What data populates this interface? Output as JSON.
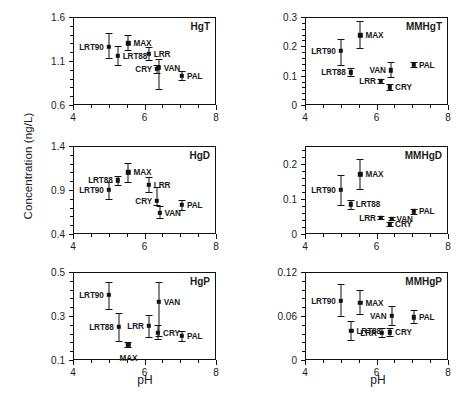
{
  "figure": {
    "y_axis_title": "Concentration (ng/L)",
    "x_axis_title": "pH",
    "site_names": [
      "LRT90",
      "LRT88",
      "MAX",
      "LRR",
      "CRY",
      "VAN",
      "PAL"
    ],
    "marker_color": "#111111"
  },
  "chart_data": [
    {
      "type": "scatter",
      "title": "HgT",
      "xlabel": "pH",
      "ylabel": "Concentration (ng/L)",
      "xlim": [
        4,
        8
      ],
      "ylim": [
        0.6,
        1.6
      ],
      "xticks": [
        4,
        6,
        8
      ],
      "xtick_labels": [
        "4",
        "6",
        "8"
      ],
      "yticks": [
        0.6,
        1.1,
        1.6
      ],
      "ytick_labels": [
        "0.6",
        "1.1",
        "1.6"
      ],
      "grid": false,
      "legend": "none",
      "points": [
        {
          "label": "LRT90",
          "x": 5.0,
          "y": 1.26,
          "ylo": 1.13,
          "yhi": 1.42,
          "label_side": "left"
        },
        {
          "label": "LRT88",
          "x": 5.25,
          "y": 1.16,
          "ylo": 1.06,
          "yhi": 1.27,
          "label_side": "right"
        },
        {
          "label": "MAX",
          "x": 5.55,
          "y": 1.3,
          "ylo": 1.23,
          "yhi": 1.39,
          "label_side": "right"
        },
        {
          "label": "LRR",
          "x": 6.12,
          "y": 1.18,
          "ylo": 1.11,
          "yhi": 1.26,
          "label_side": "right"
        },
        {
          "label": "CRY",
          "x": 6.35,
          "y": 1.01,
          "ylo": 0.96,
          "yhi": 1.06,
          "label_side": "left"
        },
        {
          "label": "VAN",
          "x": 6.4,
          "y": 1.02,
          "ylo": 0.78,
          "yhi": 1.12,
          "label_side": "right"
        },
        {
          "label": "PAL",
          "x": 7.05,
          "y": 0.93,
          "ylo": 0.88,
          "yhi": 0.99,
          "label_side": "right"
        }
      ]
    },
    {
      "type": "scatter",
      "title": "MMHgT",
      "xlabel": "pH",
      "ylabel": "Concentration (ng/L)",
      "xlim": [
        4,
        8
      ],
      "ylim": [
        0,
        0.3
      ],
      "xticks": [
        4,
        6,
        8
      ],
      "xtick_labels": [
        "4",
        "6",
        "8"
      ],
      "yticks": [
        0,
        0.1,
        0.2,
        0.3
      ],
      "ytick_labels": [
        "0",
        "0.1",
        "0.2",
        "0.3"
      ],
      "grid": false,
      "legend": "none",
      "points": [
        {
          "label": "LRT90",
          "x": 5.0,
          "y": 0.185,
          "ylo": 0.135,
          "yhi": 0.225,
          "label_side": "left"
        },
        {
          "label": "LRT88",
          "x": 5.28,
          "y": 0.112,
          "ylo": 0.1,
          "yhi": 0.125,
          "label_side": "left"
        },
        {
          "label": "MAX",
          "x": 5.55,
          "y": 0.238,
          "ylo": 0.195,
          "yhi": 0.285,
          "label_side": "right"
        },
        {
          "label": "LRR",
          "x": 6.12,
          "y": 0.082,
          "ylo": 0.074,
          "yhi": 0.09,
          "label_side": "left"
        },
        {
          "label": "CRY",
          "x": 6.38,
          "y": 0.06,
          "ylo": 0.05,
          "yhi": 0.07,
          "label_side": "right"
        },
        {
          "label": "VAN",
          "x": 6.4,
          "y": 0.118,
          "ylo": 0.095,
          "yhi": 0.148,
          "label_side": "left"
        },
        {
          "label": "PAL",
          "x": 7.05,
          "y": 0.137,
          "ylo": 0.128,
          "yhi": 0.148,
          "label_side": "right"
        }
      ]
    },
    {
      "type": "scatter",
      "title": "HgD",
      "xlabel": "pH",
      "ylabel": "Concentration (ng/L)",
      "xlim": [
        4,
        8
      ],
      "ylim": [
        0.4,
        1.4
      ],
      "xticks": [
        4,
        6,
        8
      ],
      "xtick_labels": [
        "4",
        "6",
        "8"
      ],
      "yticks": [
        0.4,
        0.9,
        1.4
      ],
      "ytick_labels": [
        "0.4",
        "0.9",
        "1.4"
      ],
      "grid": false,
      "legend": "none",
      "points": [
        {
          "label": "LRT90",
          "x": 5.0,
          "y": 0.9,
          "ylo": 0.8,
          "yhi": 0.99,
          "label_side": "left"
        },
        {
          "label": "LRT88",
          "x": 5.25,
          "y": 1.01,
          "ylo": 0.96,
          "yhi": 1.06,
          "label_side": "left"
        },
        {
          "label": "MAX",
          "x": 5.55,
          "y": 1.1,
          "ylo": 0.99,
          "yhi": 1.21,
          "label_side": "right"
        },
        {
          "label": "LRR",
          "x": 6.12,
          "y": 0.96,
          "ylo": 0.88,
          "yhi": 1.05,
          "label_side": "right"
        },
        {
          "label": "CRY",
          "x": 6.35,
          "y": 0.78,
          "ylo": 0.73,
          "yhi": 0.93,
          "label_side": "left"
        },
        {
          "label": "VAN",
          "x": 6.42,
          "y": 0.64,
          "ylo": 0.58,
          "yhi": 0.72,
          "label_side": "right"
        },
        {
          "label": "PAL",
          "x": 7.05,
          "y": 0.73,
          "ylo": 0.67,
          "yhi": 0.79,
          "label_side": "right"
        }
      ]
    },
    {
      "type": "scatter",
      "title": "MMHgD",
      "xlabel": "pH",
      "ylabel": "Concentration (ng/L)",
      "xlim": [
        4,
        8
      ],
      "ylim": [
        0,
        0.25
      ],
      "xticks": [
        4,
        6,
        8
      ],
      "xtick_labels": [
        "4",
        "6",
        "8"
      ],
      "yticks": [
        0,
        0.1,
        0.2
      ],
      "ytick_labels": [
        "0",
        "0.1",
        "0.2"
      ],
      "grid": false,
      "legend": "none",
      "points": [
        {
          "label": "LRT90",
          "x": 5.0,
          "y": 0.125,
          "ylo": 0.082,
          "yhi": 0.168,
          "label_side": "left"
        },
        {
          "label": "LRT88",
          "x": 5.28,
          "y": 0.084,
          "ylo": 0.072,
          "yhi": 0.096,
          "label_side": "right"
        },
        {
          "label": "MAX",
          "x": 5.55,
          "y": 0.17,
          "ylo": 0.128,
          "yhi": 0.212,
          "label_side": "right"
        },
        {
          "label": "LRR",
          "x": 6.12,
          "y": 0.046,
          "ylo": 0.042,
          "yhi": 0.05,
          "label_side": "left"
        },
        {
          "label": "CRY",
          "x": 6.38,
          "y": 0.028,
          "ylo": 0.022,
          "yhi": 0.035,
          "label_side": "right"
        },
        {
          "label": "VAN",
          "x": 6.42,
          "y": 0.043,
          "ylo": 0.039,
          "yhi": 0.048,
          "label_side": "right"
        },
        {
          "label": "PAL",
          "x": 7.05,
          "y": 0.065,
          "ylo": 0.058,
          "yhi": 0.072,
          "label_side": "right"
        }
      ]
    },
    {
      "type": "scatter",
      "title": "HgP",
      "xlabel": "pH",
      "ylabel": "Concentration (ng/L)",
      "xlim": [
        4,
        8
      ],
      "ylim": [
        0.1,
        0.5
      ],
      "xticks": [
        4,
        6,
        8
      ],
      "xtick_labels": [
        "4",
        "6",
        "8"
      ],
      "yticks": [
        0.1,
        0.3,
        0.5
      ],
      "ytick_labels": [
        "0.1",
        "0.3",
        "0.5"
      ],
      "grid": false,
      "legend": "none",
      "points": [
        {
          "label": "LRT90",
          "x": 5.0,
          "y": 0.395,
          "ylo": 0.33,
          "yhi": 0.455,
          "label_side": "left"
        },
        {
          "label": "LRT88",
          "x": 5.28,
          "y": 0.25,
          "ylo": 0.185,
          "yhi": 0.315,
          "label_side": "left"
        },
        {
          "label": "MAX",
          "x": 5.55,
          "y": 0.17,
          "ylo": 0.158,
          "yhi": 0.182,
          "label_side": "below"
        },
        {
          "label": "LRR",
          "x": 6.12,
          "y": 0.255,
          "ylo": 0.205,
          "yhi": 0.305,
          "label_side": "left"
        },
        {
          "label": "CRY",
          "x": 6.38,
          "y": 0.225,
          "ylo": 0.195,
          "yhi": 0.26,
          "label_side": "right"
        },
        {
          "label": "VAN",
          "x": 6.4,
          "y": 0.365,
          "ylo": 0.21,
          "yhi": 0.455,
          "label_side": "right"
        },
        {
          "label": "PAL",
          "x": 7.05,
          "y": 0.21,
          "ylo": 0.188,
          "yhi": 0.232,
          "label_side": "right"
        }
      ]
    },
    {
      "type": "scatter",
      "title": "MMHgP",
      "xlabel": "pH",
      "ylabel": "Concentration (ng/L)",
      "xlim": [
        4,
        8
      ],
      "ylim": [
        0,
        0.12
      ],
      "xticks": [
        4,
        6,
        8
      ],
      "xtick_labels": [
        "4",
        "6",
        "8"
      ],
      "yticks": [
        0,
        0.06,
        0.12
      ],
      "ytick_labels": [
        "0",
        "0.06",
        "0.12"
      ],
      "grid": false,
      "legend": "none",
      "points": [
        {
          "label": "LRT90",
          "x": 5.0,
          "y": 0.081,
          "ylo": 0.06,
          "yhi": 0.104,
          "label_side": "left"
        },
        {
          "label": "LRT88",
          "x": 5.3,
          "y": 0.04,
          "ylo": 0.027,
          "yhi": 0.053,
          "label_side": "right"
        },
        {
          "label": "MAX",
          "x": 5.55,
          "y": 0.078,
          "ylo": 0.063,
          "yhi": 0.096,
          "label_side": "right"
        },
        {
          "label": "LRR",
          "x": 6.15,
          "y": 0.037,
          "ylo": 0.031,
          "yhi": 0.044,
          "label_side": "left"
        },
        {
          "label": "CRY",
          "x": 6.38,
          "y": 0.038,
          "ylo": 0.033,
          "yhi": 0.044,
          "label_side": "right"
        },
        {
          "label": "VAN",
          "x": 6.42,
          "y": 0.06,
          "ylo": 0.048,
          "yhi": 0.074,
          "label_side": "left"
        },
        {
          "label": "PAL",
          "x": 7.05,
          "y": 0.058,
          "ylo": 0.05,
          "yhi": 0.068,
          "label_side": "right"
        }
      ]
    }
  ]
}
